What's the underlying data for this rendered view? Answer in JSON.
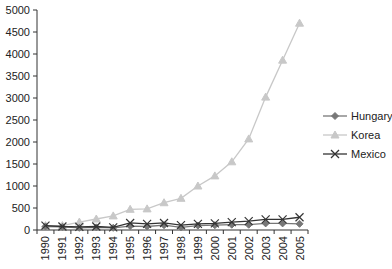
{
  "chart_data": {
    "type": "line",
    "title": "",
    "xlabel": "",
    "ylabel": "",
    "x": [
      "1990",
      "1991",
      "1992",
      "1993",
      "1994",
      "1995",
      "1996",
      "1997",
      "1998",
      "1999",
      "2000",
      "2001",
      "2002",
      "2003",
      "2004",
      "2005"
    ],
    "ylim": [
      0,
      5000
    ],
    "yticks": [
      0,
      500,
      1000,
      1500,
      2000,
      2500,
      3000,
      3500,
      4000,
      4500,
      5000
    ],
    "grid": false,
    "legend_position": "right",
    "series": [
      {
        "name": "Hungary",
        "marker": "diamond",
        "color": "#777777",
        "values": [
          80,
          70,
          50,
          60,
          50,
          90,
          80,
          110,
          60,
          100,
          110,
          120,
          120,
          150,
          150,
          140
        ]
      },
      {
        "name": "Korea",
        "marker": "triangle",
        "color": "#c8c8c8",
        "values": [
          100,
          100,
          180,
          250,
          320,
          470,
          480,
          620,
          720,
          1000,
          1230,
          1550,
          2070,
          3020,
          3860,
          4700
        ]
      },
      {
        "name": "Mexico",
        "marker": "x",
        "color": "#333333",
        "values": [
          100,
          80,
          70,
          80,
          60,
          160,
          140,
          160,
          110,
          140,
          150,
          180,
          200,
          240,
          240,
          290
        ]
      }
    ]
  }
}
